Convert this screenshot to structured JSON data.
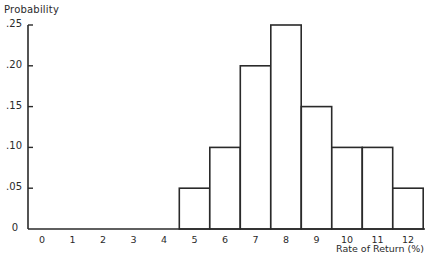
{
  "chart_data": {
    "type": "bar",
    "title": "",
    "xlabel": "Rate of Return (%)",
    "ylabel": "Probability",
    "categories": [
      "0",
      "1",
      "2",
      "3",
      "4",
      "5",
      "6",
      "7",
      "8",
      "9",
      "10",
      "11",
      "12"
    ],
    "values": [
      0,
      0,
      0,
      0,
      0,
      0.05,
      0.1,
      0.2,
      0.25,
      0.15,
      0.1,
      0.1,
      0.05
    ],
    "ylim": [
      0,
      0.25
    ],
    "yticks": [
      0,
      0.05,
      0.1,
      0.15,
      0.2,
      0.25
    ],
    "ytick_labels": [
      "0",
      ".05",
      ".10",
      ".15",
      ".20",
      ".25"
    ],
    "grid": false,
    "legend": null,
    "bar_style": {
      "fill": "#ffffff",
      "stroke": "#2a2a2a"
    }
  },
  "labels": {
    "ylabel": "Probability",
    "xlabel": "Rate of Return (%)"
  }
}
